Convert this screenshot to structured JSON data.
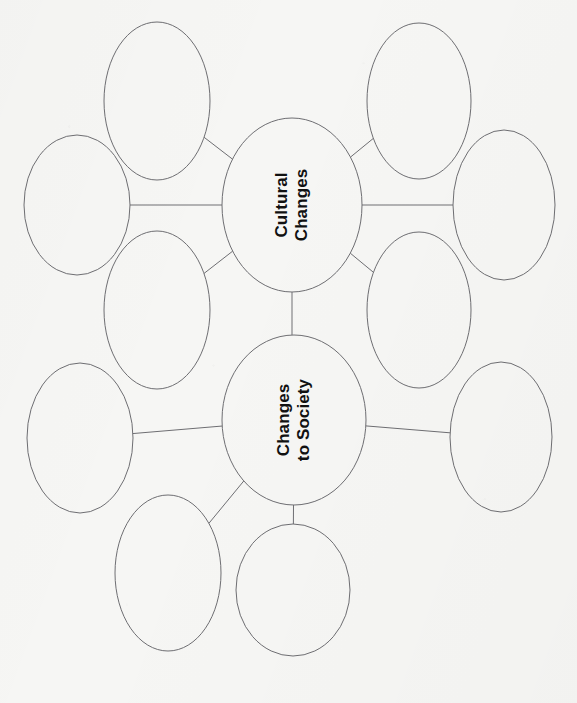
{
  "document": {
    "kind": "graphic-organizer-worksheet",
    "orientation_note": "page scanned sideways; node text reads bottom-to-top (rotated 90 degrees counter-clockwise)",
    "page_width": 577,
    "page_height": 703,
    "background_color": "#f6f6f4",
    "stroke_color": "#6e6e72",
    "text_color": "#111111",
    "top_edge_artifact": "· ·   ·    ·      ·"
  },
  "clusters": [
    {
      "id": "cluster-cultural-changes",
      "center_label": "Cultural\nChanges",
      "center_label_lines": [
        "Cultural",
        "Changes"
      ],
      "center_font_size": 17,
      "center": {
        "cx": 292,
        "cy": 205,
        "rx": 70,
        "ry": 87
      },
      "satellites": [
        {
          "id": "cultural-satellite-1",
          "label": "",
          "cx": 157,
          "cy": 101,
          "rx": 53,
          "ry": 79
        },
        {
          "id": "cultural-satellite-2",
          "label": "",
          "cx": 77,
          "cy": 205,
          "rx": 53,
          "ry": 70
        },
        {
          "id": "cultural-satellite-3",
          "label": "",
          "cx": 157,
          "cy": 310,
          "rx": 53,
          "ry": 79
        },
        {
          "id": "cultural-satellite-4",
          "label": "",
          "cx": 419,
          "cy": 101,
          "rx": 52,
          "ry": 78
        },
        {
          "id": "cultural-satellite-5",
          "label": "",
          "cx": 504,
          "cy": 205,
          "rx": 51,
          "ry": 75
        },
        {
          "id": "cultural-satellite-6",
          "label": "",
          "cx": 419,
          "cy": 310,
          "rx": 52,
          "ry": 78
        }
      ],
      "connectors": [
        {
          "from": "center",
          "to": "cultural-satellite-1"
        },
        {
          "from": "center",
          "to": "cultural-satellite-2"
        },
        {
          "from": "center",
          "to": "cultural-satellite-3"
        },
        {
          "from": "center",
          "to": "cultural-satellite-4"
        },
        {
          "from": "center",
          "to": "cultural-satellite-5"
        },
        {
          "from": "center",
          "to": "cultural-satellite-6"
        }
      ]
    },
    {
      "id": "cluster-changes-to-society",
      "center_label": "Changes\nto Society",
      "center_label_lines": [
        "Changes",
        "to Society"
      ],
      "center_font_size": 17,
      "center": {
        "cx": 294,
        "cy": 420,
        "rx": 72,
        "ry": 85
      },
      "satellites": [
        {
          "id": "society-satellite-1",
          "label": "",
          "cx": 157,
          "cy": 310,
          "rx": 53,
          "ry": 79
        },
        {
          "id": "society-satellite-2",
          "label": "",
          "cx": 80,
          "cy": 438,
          "rx": 53,
          "ry": 75
        },
        {
          "id": "society-satellite-3",
          "label": "",
          "cx": 168,
          "cy": 573,
          "rx": 53,
          "ry": 78
        },
        {
          "id": "society-satellite-4",
          "label": "",
          "cx": 419,
          "cy": 310,
          "rx": 52,
          "ry": 78
        },
        {
          "id": "society-satellite-5",
          "label": "",
          "cx": 501,
          "cy": 437,
          "rx": 51,
          "ry": 75
        },
        {
          "id": "society-satellite-6",
          "label": "",
          "cx": 293,
          "cy": 590,
          "rx": 57,
          "ry": 66
        }
      ],
      "connectors": [
        {
          "from": "center",
          "to": "society-satellite-2"
        },
        {
          "from": "center",
          "to": "society-satellite-3"
        },
        {
          "from": "center",
          "to": "society-satellite-5"
        },
        {
          "from": "center",
          "to": "society-satellite-6"
        }
      ]
    }
  ],
  "inter_cluster_connector": {
    "id": "connector-cultural-to-society",
    "from": "cluster-cultural-changes",
    "to": "cluster-changes-to-society",
    "x": 292,
    "y1": 292,
    "y2": 335
  }
}
